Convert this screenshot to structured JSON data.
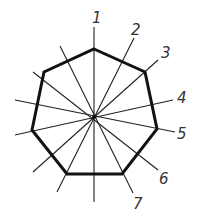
{
  "diagram": {
    "type": "heptagon-construction",
    "center": [
      94,
      117
    ],
    "colors": {
      "polygon": "#111111",
      "lines": "#222222",
      "labels": "#333333"
    },
    "polygon": {
      "name": "heptagon",
      "vertices": [
        [
          94,
          49
        ],
        [
          145,
          72
        ],
        [
          157,
          129
        ],
        [
          122,
          174
        ],
        [
          67,
          174
        ],
        [
          32,
          130
        ],
        [
          44,
          72
        ]
      ]
    },
    "lines": [
      {
        "id": "1",
        "from": [
          94,
          27
        ],
        "to": [
          94,
          202
        ]
      },
      {
        "id": "2",
        "from": [
          134,
          38
        ],
        "to": [
          57,
          192
        ]
      },
      {
        "id": "3",
        "from": [
          158,
          60
        ],
        "to": [
          33,
          172
        ]
      },
      {
        "id": "4",
        "from": [
          173,
          100
        ],
        "to": [
          15,
          135
        ]
      },
      {
        "id": "5",
        "from": [
          175,
          132
        ],
        "to": [
          15,
          100
        ]
      },
      {
        "id": "6",
        "from": [
          158,
          170
        ],
        "to": [
          33,
          72
        ]
      },
      {
        "id": "7",
        "from": [
          133,
          193
        ],
        "to": [
          60,
          46
        ]
      }
    ],
    "labels": [
      {
        "text": "1",
        "x": 92,
        "y": 23
      },
      {
        "text": "2",
        "x": 131,
        "y": 35
      },
      {
        "text": "3",
        "x": 161,
        "y": 58
      },
      {
        "text": "4",
        "x": 177,
        "y": 103
      },
      {
        "text": "5",
        "x": 177,
        "y": 139
      },
      {
        "text": "6",
        "x": 159,
        "y": 184
      },
      {
        "text": "7",
        "x": 133,
        "y": 209
      }
    ]
  }
}
